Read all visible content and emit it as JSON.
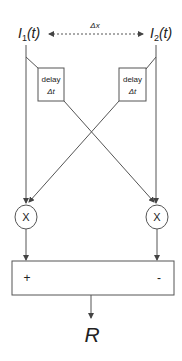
{
  "diagram": {
    "type": "correlation-detector",
    "inputs": {
      "left": {
        "label_main": "I",
        "label_sub": "1",
        "label_arg": "(t)"
      },
      "right": {
        "label_main": "I",
        "label_sub": "2",
        "label_arg": "(t)"
      }
    },
    "separation_label": "Δx",
    "delay_boxes": {
      "left": {
        "line1": "delay",
        "line2": "Δt"
      },
      "right": {
        "line1": "delay",
        "line2": "Δt"
      }
    },
    "multipliers": {
      "left": {
        "symbol": "X"
      },
      "right": {
        "symbol": "X"
      }
    },
    "subtractor": {
      "plus_sign": "+",
      "minus_sign": "-"
    },
    "output": {
      "label": "R"
    },
    "colors": {
      "stroke": "#555555",
      "text": "#222222",
      "background": "#ffffff"
    }
  }
}
